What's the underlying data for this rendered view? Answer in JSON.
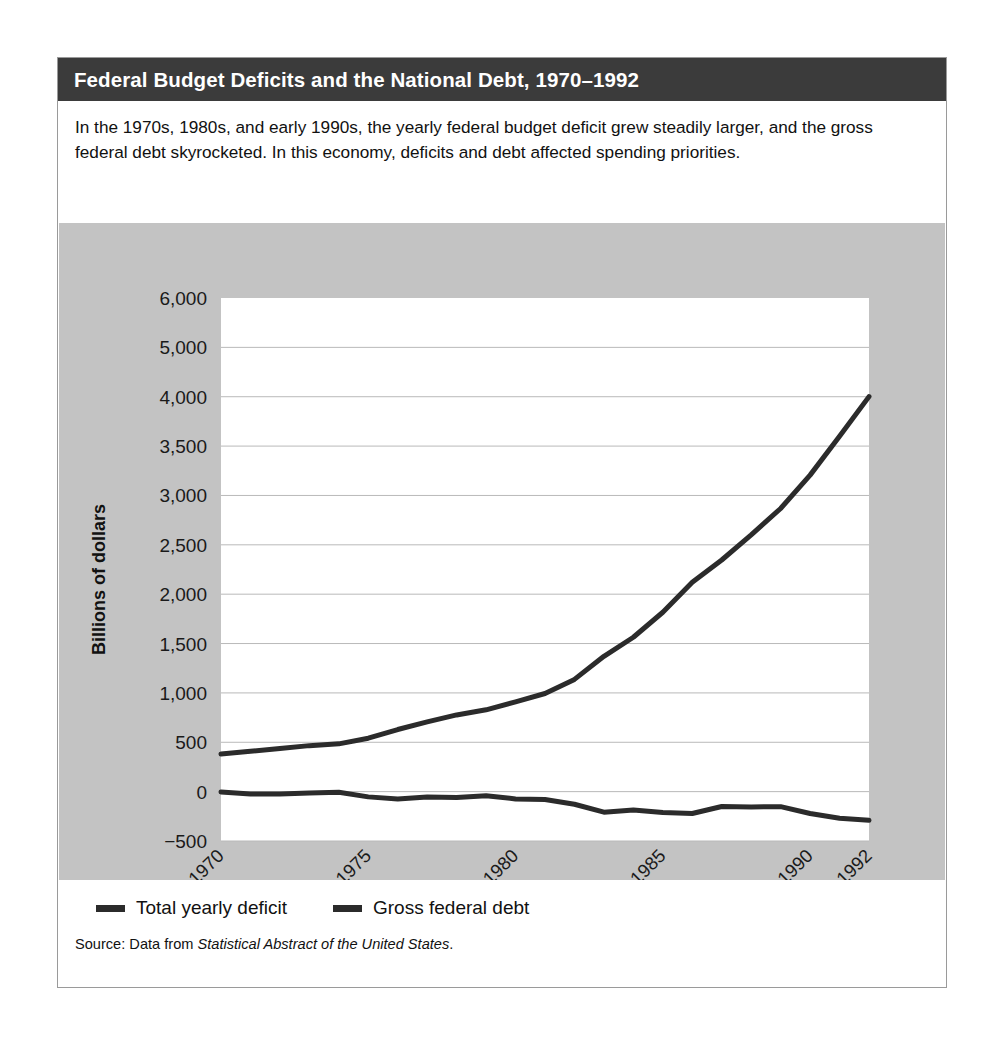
{
  "figure": {
    "title": "Federal Budget Deficits and the National Debt, 1970–1992",
    "caption": "In the 1970s, 1980s, and early 1990s, the yearly federal budget deficit grew steadily larger, and the gross federal debt skyrocketed. In this economy, deficits and debt affected spending priorities.",
    "source_prefix": "Source: Data from ",
    "source_italic": "Statistical Abstract of the United States",
    "source_suffix": "."
  },
  "colors": {
    "title_bar": "#3b3b3b",
    "panel_background": "#c3c3c3",
    "plot_background": "#ffffff",
    "line": "#2b2b2b",
    "gridline": "#b9b9b9",
    "frame_border": "#9a9a9a"
  },
  "legend": {
    "items": [
      {
        "label": "Total yearly deficit",
        "color": "#2b2b2b"
      },
      {
        "label": "Gross federal debt",
        "color": "#2b2b2b"
      }
    ]
  },
  "chart_data": {
    "type": "line",
    "title": "Federal Budget Deficits and the National Debt, 1970–1992",
    "xlabel": "Year",
    "ylabel": "Billions of dollars",
    "grid": true,
    "legend_position": "below",
    "x_tick_labels": [
      "1970",
      "1975",
      "1980",
      "1985",
      "1990",
      "1992"
    ],
    "x_tick_values": [
      1970,
      1975,
      1980,
      1985,
      1990,
      1992
    ],
    "xlim": [
      1970,
      1992
    ],
    "y_tick_labels": [
      "6,000",
      "5,000",
      "4,000",
      "3,500",
      "3,000",
      "2,500",
      "2,000",
      "1,500",
      "1,000",
      "500",
      "0",
      "−500"
    ],
    "y_tick_values": [
      6000,
      5000,
      4000,
      3500,
      3000,
      2500,
      2000,
      1500,
      1000,
      500,
      0,
      -500
    ],
    "y_axis_note": "tick labels evenly spaced (non-linear above 4,000)",
    "x": [
      1970,
      1971,
      1972,
      1973,
      1974,
      1975,
      1976,
      1977,
      1978,
      1979,
      1980,
      1981,
      1982,
      1983,
      1984,
      1985,
      1986,
      1987,
      1988,
      1989,
      1990,
      1991,
      1992
    ],
    "series": [
      {
        "name": "Total yearly deficit",
        "color": "#2b2b2b",
        "values": [
          -3,
          -23,
          -23,
          -15,
          -6,
          -53,
          -74,
          -54,
          -59,
          -41,
          -74,
          -79,
          -128,
          -208,
          -185,
          -212,
          -221,
          -150,
          -155,
          -152,
          -221,
          -269,
          -290
        ]
      },
      {
        "name": "Gross federal debt",
        "color": "#2b2b2b",
        "values": [
          381,
          408,
          436,
          466,
          484,
          541,
          629,
          706,
          777,
          829,
          909,
          994,
          1137,
          1371,
          1564,
          1817,
          2120,
          2346,
          2601,
          2868,
          3206,
          3599,
          4002
        ]
      }
    ]
  }
}
